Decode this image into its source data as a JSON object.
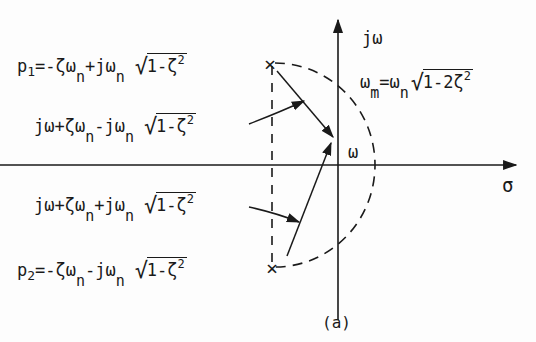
{
  "figure": {
    "caption": "(a)",
    "axes": {
      "imag_label": "jω",
      "real_label": "σ",
      "omega_label": "ω"
    },
    "labels": {
      "p1": {
        "lhs": "p",
        "sub": "1",
        "expr": "=-ζω",
        "n1": "n",
        "mid": "+jω",
        "n2": "n",
        "root": "1-ζ",
        "pow": "2"
      },
      "vec_upper": {
        "expr": "jω+ζω",
        "n1": "n",
        "mid": "-jω",
        "n2": "n",
        "root": "1-ζ",
        "pow": "2"
      },
      "vec_lower": {
        "expr": "jω+ζω",
        "n1": "n",
        "mid": "+jω",
        "n2": "n",
        "root": "1-ζ",
        "pow": "2"
      },
      "p2": {
        "lhs": "p",
        "sub": "2",
        "expr": "=-ζω",
        "n1": "n",
        "mid": "-jω",
        "n2": "n",
        "root": "1-ζ",
        "pow": "2"
      },
      "omega_m": {
        "w": "ω",
        "m": "m",
        "eq": "=ω",
        "n": "n",
        "root": "1-2ζ",
        "pow": "2"
      }
    },
    "markers": {
      "pole_symbol": "×"
    },
    "colors": {
      "ink": "#1a1a1a",
      "background": "#fdfdfd"
    }
  }
}
